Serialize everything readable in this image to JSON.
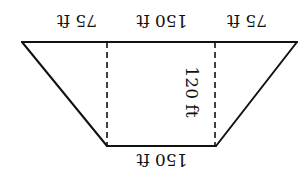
{
  "figure": {
    "orientation": "rotated-180",
    "stroke_color": "#111111",
    "background": "#ffffff",
    "labels": {
      "top_left_segment": "75 ft",
      "top_middle_segment": "150 ft",
      "top_right_segment": "75 ft",
      "height": "120 ft",
      "bottom_base": "150 ft"
    }
  }
}
